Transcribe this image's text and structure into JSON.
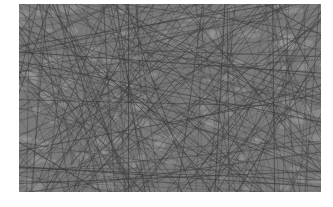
{
  "image": {
    "subject": "dense mesh of crossing thin dark fibers/lines over gray background",
    "colors": {
      "background": "#ffffff",
      "base": "#7a7a7a",
      "light": "#9a9a9a",
      "line": "#3c3c3c"
    },
    "region": {
      "x": 19,
      "y": 4,
      "width": 302,
      "height": 188
    }
  }
}
